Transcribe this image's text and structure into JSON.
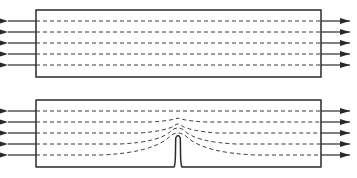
{
  "diagram": {
    "colors": {
      "stroke": "#2a2a2a",
      "dashed": "#3a3a3a",
      "background": "#ffffff"
    },
    "panels": [
      {
        "name": "uncracked-plate",
        "rect": {
          "x": 36,
          "y": 10,
          "w": 285,
          "h": 67
        },
        "line_ys": [
          21,
          32,
          43,
          54,
          65
        ],
        "has_crack": false
      },
      {
        "name": "cracked-plate",
        "rect": {
          "x": 36,
          "y": 100,
          "w": 285,
          "h": 67
        },
        "line_ys": [
          111,
          122,
          133,
          144,
          155
        ],
        "has_crack": true,
        "crack": {
          "x": 178,
          "tip_y": 136
        }
      }
    ]
  }
}
